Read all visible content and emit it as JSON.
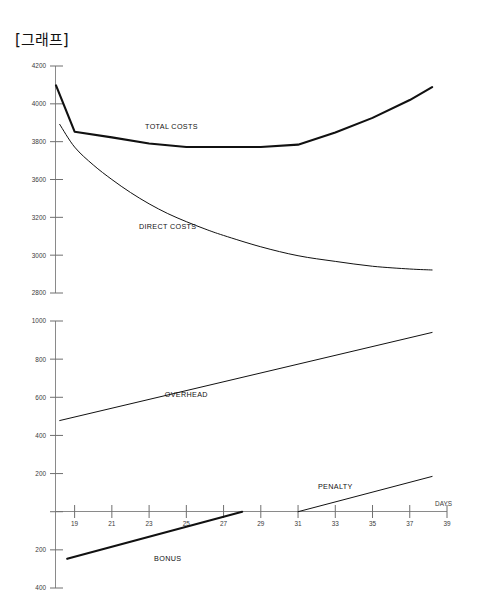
{
  "page": {
    "title": "[그래프]",
    "background_color": "#ffffff",
    "line_color": "#111111",
    "axis_color": "#8a8a8a"
  },
  "chart_data": [
    {
      "type": "line",
      "title": "[그래프]",
      "panel": "upper",
      "xlabel": "",
      "ylabel": "",
      "xlim": [
        18,
        39
      ],
      "ylim": [
        2800,
        4200
      ],
      "grid": false,
      "legend": "inline-annotations",
      "x_ticks": [
        19,
        21,
        23,
        25,
        27,
        29,
        31,
        33,
        35,
        37,
        39
      ],
      "y_ticks": [
        2800,
        3000,
        3200,
        3600,
        3800,
        4000,
        4200
      ],
      "y_tick_labels": [
        "2800",
        "3000",
        "3200",
        "3600",
        "3800",
        "4000",
        "4200"
      ],
      "series": [
        {
          "name": "TOTAL COSTS",
          "label_x": 24.2,
          "label_y": 3810,
          "line_weight": "thick",
          "x": [
            18.0,
            19.0,
            21.0,
            23.0,
            25.0,
            27.0,
            29.0,
            31.0,
            33.0,
            35.0,
            37.0,
            38.2
          ],
          "values": [
            4080,
            3795,
            3760,
            3722,
            3700,
            3700,
            3700,
            3715,
            3790,
            3880,
            3990,
            4070
          ]
        },
        {
          "name": "DIRECT COSTS",
          "label_x": 24.0,
          "label_y": 3195,
          "line_weight": "thin",
          "x": [
            18.2,
            19.0,
            20.0,
            21.0,
            22.0,
            23.0,
            24.0,
            25.0,
            26.0,
            27.0,
            29.0,
            31.0,
            33.0,
            35.0,
            37.0,
            38.2
          ],
          "values": [
            3840,
            3700,
            3590,
            3500,
            3420,
            3350,
            3290,
            3240,
            3195,
            3155,
            3085,
            3030,
            2995,
            2965,
            2948,
            2942
          ]
        }
      ]
    },
    {
      "type": "line",
      "panel": "lower",
      "xlabel": "DAYS",
      "ylabel": "",
      "xlim": [
        18,
        39
      ],
      "ylim": [
        -400,
        1000
      ],
      "grid": false,
      "legend": "inline-annotations",
      "x_ticks": [
        19,
        21,
        23,
        25,
        27,
        29,
        31,
        33,
        35,
        37,
        39
      ],
      "x_tick_labels": [
        "19",
        "21",
        "23",
        "25",
        "27",
        "29",
        "31",
        "33",
        "35",
        "37",
        "39"
      ],
      "y_ticks": [
        -400,
        -200,
        0,
        200,
        400,
        600,
        800,
        1000
      ],
      "y_tick_labels": [
        "400",
        "200",
        "",
        "200",
        "400",
        "600",
        "800",
        "1000"
      ],
      "series": [
        {
          "name": "OVERHEAD",
          "label_x": 25.0,
          "label_y": 600,
          "line_weight": "thin",
          "x": [
            18.2,
            38.2
          ],
          "values": [
            478,
            940
          ]
        },
        {
          "name": "PENALTY",
          "label_x": 33.0,
          "label_y": 120,
          "line_weight": "thin",
          "x": [
            31.0,
            38.2
          ],
          "values": [
            0,
            185
          ]
        },
        {
          "name": "BONUS",
          "label_x": 24.0,
          "label_y": -260,
          "line_weight": "thick",
          "x": [
            18.6,
            28.0
          ],
          "values": [
            -247,
            0
          ]
        }
      ]
    }
  ]
}
